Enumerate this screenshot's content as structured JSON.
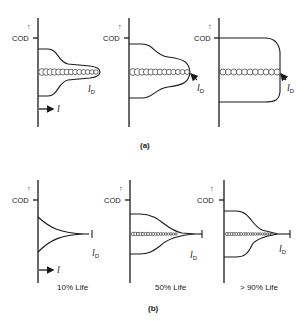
{
  "figure": {
    "part_a": {
      "caption": "(a)",
      "panels": [
        {
          "axis_label": "COD",
          "up_arrow": "↑",
          "length_symbol": "l",
          "damage_label": "l",
          "damage_sub": "D"
        },
        {
          "axis_label": "COD",
          "up_arrow": "↑",
          "damage_label": "l",
          "damage_sub": "D"
        },
        {
          "axis_label": "COD",
          "up_arrow": "↑",
          "damage_label": "l",
          "damage_sub": "D"
        }
      ]
    },
    "part_b": {
      "caption": "(b)",
      "panels": [
        {
          "axis_label": "COD",
          "up_arrow": "↑",
          "length_symbol": "l",
          "damage_label": "l",
          "damage_sub": "D",
          "life": "10% Life"
        },
        {
          "axis_label": "COD",
          "up_arrow": "↑",
          "damage_label": "l",
          "damage_sub": "D",
          "life": "50% Life"
        },
        {
          "axis_label": "COD",
          "up_arrow": "↑",
          "damage_label": "l",
          "damage_sub": "D",
          "life": "> 90% Life"
        }
      ]
    }
  }
}
